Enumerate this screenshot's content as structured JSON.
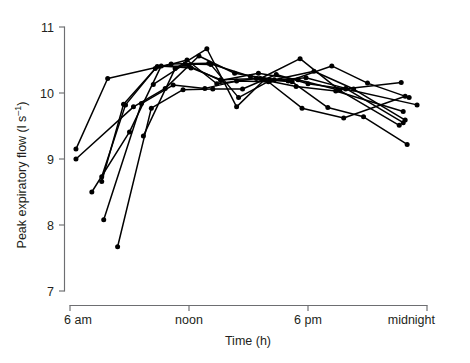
{
  "chart_data": {
    "type": "line",
    "title": "",
    "subtitle": "",
    "xlabel": "Time (h)",
    "ylabel": "Peak expiratory flow (l s⁻¹)",
    "ylabel_main": "Peak expiratory flow (l s",
    "ylabel_sup": "–1",
    "ylabel_tail": ")",
    "xlim": [
      6,
      24
    ],
    "ylim": [
      7,
      11
    ],
    "grid": false,
    "legend": "none",
    "x_tick_values": [
      6,
      12,
      18,
      24
    ],
    "x_tick_labels": [
      "6 am",
      "noon",
      "6 pm",
      "midnight"
    ],
    "y_tick_values": [
      7,
      8,
      9,
      10,
      11
    ],
    "y_tick_labels": [
      "7",
      "8",
      "9",
      "10",
      "11"
    ],
    "marker": "filled-circle",
    "series": [
      {
        "name": "subject-1",
        "x": [
          6.3,
          7.9,
          11.1,
          13.0,
          15.1,
          17.0,
          19.2,
          21.0,
          23.1
        ],
        "values": [
          9.15,
          10.22,
          10.44,
          10.45,
          10.25,
          10.18,
          10.41,
          10.15,
          9.93
        ]
      },
      {
        "name": "subject-2",
        "x": [
          6.3,
          9.2,
          10.8,
          12.5,
          14.3,
          16.3,
          18.3,
          20.3,
          22.9
        ],
        "values": [
          9.0,
          9.79,
          10.07,
          10.56,
          10.3,
          10.2,
          10.33,
          10.06,
          9.59
        ]
      },
      {
        "name": "subject-3",
        "x": [
          7.1,
          9.0,
          10.6,
          12.1,
          13.6,
          15.6,
          17.6,
          19.6,
          22.6
        ],
        "values": [
          8.5,
          9.41,
          10.41,
          10.38,
          10.2,
          10.22,
          10.52,
          10.04,
          9.51
        ]
      },
      {
        "name": "subject-4",
        "x": [
          7.6,
          8.7,
          10.4,
          12.0,
          13.6,
          15.5,
          17.5,
          19.5,
          22.7
        ],
        "values": [
          8.66,
          9.83,
          10.4,
          10.41,
          10.19,
          10.3,
          10.2,
          10.05,
          10.16
        ]
      },
      {
        "name": "subject-5",
        "x": [
          7.6,
          8.8,
          10.3,
          11.9,
          13.4,
          15.4,
          17.4,
          19.4,
          22.8
        ],
        "values": [
          8.73,
          9.82,
          10.37,
          10.5,
          10.14,
          10.22,
          10.1,
          10.03,
          9.72
        ]
      },
      {
        "name": "subject-6",
        "x": [
          7.7,
          9.6,
          11.2,
          12.8,
          14.4,
          16.0,
          17.7,
          19.8,
          22.9
        ],
        "values": [
          8.08,
          9.84,
          10.12,
          10.07,
          10.18,
          10.17,
          9.77,
          9.62,
          9.95
        ]
      },
      {
        "name": "subject-7",
        "x": [
          8.4,
          10.1,
          11.7,
          13.2,
          14.7,
          16.4,
          18.0,
          19.9,
          23.5
        ],
        "values": [
          7.67,
          9.77,
          10.05,
          10.06,
          10.06,
          10.28,
          10.14,
          10.06,
          9.82
        ]
      },
      {
        "name": "subject-8",
        "x": [
          9.7,
          11.3,
          12.9,
          14.4,
          15.8,
          17.2,
          19.0,
          20.8,
          23.0
        ],
        "values": [
          9.35,
          10.37,
          10.67,
          9.79,
          10.2,
          10.17,
          9.78,
          9.64,
          9.22
        ]
      },
      {
        "name": "subject-9",
        "x": [
          10.2,
          11.8,
          13.1,
          14.5,
          16.1,
          17.9,
          19.9,
          22.8
        ],
        "values": [
          10.13,
          10.44,
          10.43,
          9.93,
          10.19,
          10.23,
          10.07,
          9.55
        ]
      }
    ]
  },
  "axes": {
    "y_axis_name": "y-axis",
    "x_axis_name": "x-axis"
  }
}
